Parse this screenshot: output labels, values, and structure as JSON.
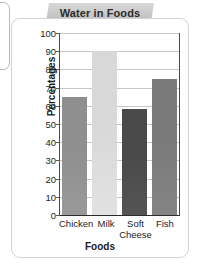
{
  "title": "Water in Foods",
  "chart_data": {
    "type": "bar",
    "title": "Water in Foods",
    "xlabel": "Foods",
    "ylabel": "Percentages",
    "categories": [
      "Chicken",
      "Milk",
      "Soft Cheese",
      "Fish"
    ],
    "category_lines": [
      [
        "Chicken"
      ],
      [
        "Milk"
      ],
      [
        "Soft",
        "Cheese"
      ],
      [
        "Fish"
      ]
    ],
    "values": [
      65,
      90,
      58,
      75
    ],
    "ylim": [
      0,
      100
    ],
    "yticks": [
      100,
      90,
      80,
      70,
      60,
      50,
      40,
      30,
      20,
      10,
      0
    ],
    "grid": true,
    "legend": "none",
    "bar_colors": [
      "#8f8f8f",
      "#d8d8d8",
      "#4a4a4a",
      "#7a7a7a"
    ]
  }
}
